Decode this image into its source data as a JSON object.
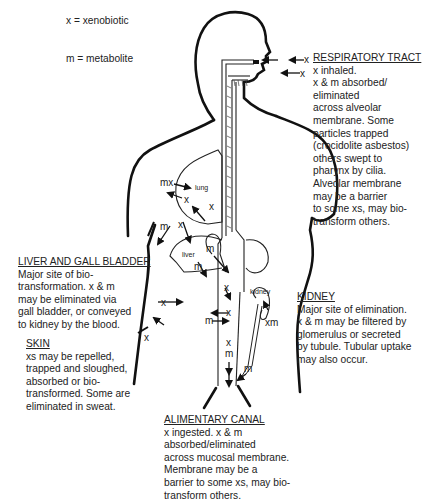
{
  "legend": {
    "xenobiotic": "x = xenobiotic",
    "metabolite": "m = metabolite"
  },
  "respiratory": {
    "title": "RESPIRATORY TRACT",
    "lines": [
      "x inhaled.",
      "x & m absorbed/",
      "eliminated",
      "across alveolar",
      "membrane. Some",
      "particles trapped",
      "(crocidolite asbestos)",
      "others swept to",
      "pharynx by cilia.",
      "Alveolar membrane",
      "may be a barrier",
      "to some xs, may bio-",
      "transform others."
    ]
  },
  "liver": {
    "title": "LIVER AND GALL BLADDER",
    "lines": [
      "Major site of bio-",
      "transformation.  x & m",
      "may be eliminated via",
      "gall bladder, or conveyed",
      "to kidney by the blood."
    ]
  },
  "skin": {
    "title": "SKIN",
    "lines": [
      "xs may be repelled,",
      "trapped and sloughed,",
      "absorbed or bio-",
      "transformed. Some are",
      "eliminated in sweat."
    ]
  },
  "kidney": {
    "title": "KIDNEY",
    "lines": [
      "Major site of elimination.",
      "x & m may be filtered by",
      "glomerulus or secreted",
      "by tubule. Tubular uptake",
      "may also occur."
    ]
  },
  "alimentary": {
    "title": "ALIMENTARY CANAL",
    "lines": [
      "x ingested.  x & m",
      "absorbed/eliminated",
      "across mucosal membrane.",
      "Membrane may be a",
      "barrier to some xs, may bio-",
      "transform others."
    ]
  },
  "diagram_labels": {
    "lung": "lung",
    "liver": "liver",
    "kidney": "kidney",
    "x": "x",
    "m": "m",
    "mx": "mx",
    "xm": "xm"
  }
}
